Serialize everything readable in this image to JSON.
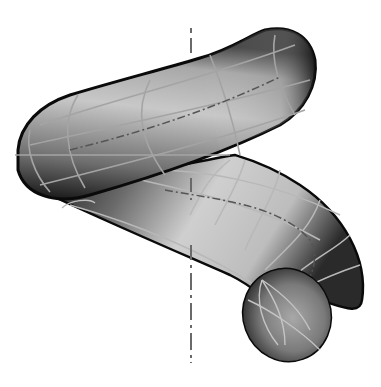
{
  "figure": {
    "background": "#ffffff",
    "colors": {
      "outline": "#0a0a0a",
      "surface_light": "#d8d8d8",
      "surface_mid": "#9a9a9a",
      "surface_dark": "#1a1a1a",
      "grid_lines": "#b8b8b8",
      "axis_line": "#6a6a6a",
      "centerline": "#555555"
    }
  }
}
